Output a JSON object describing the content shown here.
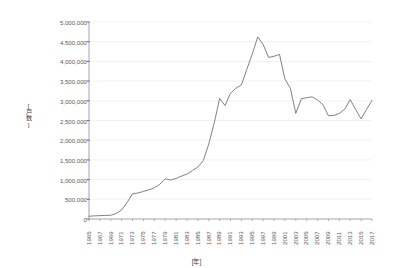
{
  "chart_data": {
    "type": "line",
    "title": "",
    "xlabel": "[年]",
    "ylabel": "[戸数]",
    "ylim": [
      0,
      5000000
    ],
    "xlim": [
      1965,
      2017
    ],
    "grid": true,
    "legend_position": "none",
    "line_color": "#7a7a7a",
    "y_ticks": [
      "0",
      "500,000",
      "1,000,000",
      "1,500,000",
      "2,000,000",
      "2,500,000",
      "3,000,000",
      "3,500,000",
      "4,000,000",
      "4,500,000",
      "5,000,000"
    ],
    "y_tick_values": [
      0,
      500000,
      1000000,
      1500000,
      2000000,
      2500000,
      3000000,
      3500000,
      4000000,
      4500000,
      5000000
    ],
    "x_ticks": [
      "1965",
      "1967",
      "1969",
      "1971",
      "1973",
      "1975",
      "1977",
      "1979",
      "1981",
      "1983",
      "1985",
      "1987",
      "1989",
      "1991",
      "1993",
      "1995",
      "1997",
      "1999",
      "2001",
      "2003",
      "2005",
      "2007",
      "2009",
      "2011",
      "2013",
      "2015",
      "2017"
    ],
    "x": [
      1965,
      1966,
      1967,
      1968,
      1969,
      1970,
      1971,
      1972,
      1973,
      1974,
      1975,
      1976,
      1977,
      1978,
      1979,
      1980,
      1981,
      1982,
      1983,
      1984,
      1985,
      1986,
      1987,
      1988,
      1989,
      1990,
      1991,
      1992,
      1993,
      1994,
      1995,
      1996,
      1997,
      1998,
      1999,
      2000,
      2001,
      2002,
      2003,
      2004,
      2005,
      2006,
      2007,
      2008,
      2009,
      2010,
      2011,
      2012,
      2013,
      2014,
      2015,
      2016,
      2017
    ],
    "series": [
      {
        "name": "戸数",
        "values": [
          70000,
          80000,
          85000,
          90000,
          95000,
          140000,
          230000,
          420000,
          640000,
          660000,
          700000,
          740000,
          790000,
          880000,
          1020000,
          990000,
          1030000,
          1090000,
          1140000,
          1230000,
          1320000,
          1480000,
          1900000,
          2430000,
          3060000,
          2880000,
          3190000,
          3320000,
          3400000,
          3800000,
          4190000,
          4620000,
          4430000,
          4100000,
          4130000,
          4180000,
          3550000,
          3320000,
          2680000,
          3050000,
          3080000,
          3100000,
          3020000,
          2900000,
          2620000,
          2630000,
          2680000,
          2790000,
          3030000,
          2780000,
          2540000,
          2780000,
          3010000
        ]
      }
    ]
  }
}
